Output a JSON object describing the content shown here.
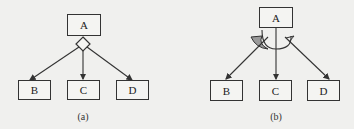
{
  "diagram_a": {
    "caption": "(a)",
    "nodes": {
      "top": "A",
      "left": "B",
      "middle": "C",
      "right": "D"
    },
    "connector": "diamond"
  },
  "diagram_b": {
    "caption": "(b)",
    "nodes": {
      "top": "A",
      "left": "B",
      "middle": "C",
      "right": "D"
    },
    "connector": "curved-arrow-arc"
  },
  "colors": {
    "line": "#333333",
    "arc_fill": "#9a9a9a",
    "background": "#f0f0ee"
  }
}
